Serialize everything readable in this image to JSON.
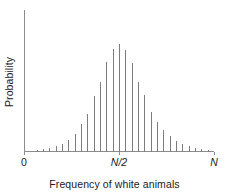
{
  "chart_data": {
    "type": "bar",
    "title": "",
    "subtitle": "",
    "xlabel": "Frequency of white animals",
    "ylabel": "Probability",
    "grid": false,
    "legend": null,
    "style": {
      "bar_color": "#7d7d7d",
      "axis_color": "#8c8c8c",
      "text_color": "#1a1a1a",
      "background": "#ffffff",
      "bar_width_px": 1
    },
    "xlim": [
      0,
      30
    ],
    "ylim": [
      0,
      1.0
    ],
    "x_tick_positions": [
      0,
      15,
      30
    ],
    "x_tick_labels": [
      "0",
      "N/2",
      "N"
    ],
    "x_tick_label_styles": [
      "normal",
      "italic",
      "italic"
    ],
    "categories": [
      0,
      1,
      2,
      3,
      4,
      5,
      6,
      7,
      8,
      9,
      10,
      11,
      12,
      13,
      14,
      15,
      16,
      17,
      18,
      19,
      20,
      21,
      22,
      23,
      24,
      25,
      26,
      27,
      28,
      29,
      30
    ],
    "values": [
      0.0,
      0.0,
      0.012,
      0.021,
      0.028,
      0.042,
      0.056,
      0.085,
      0.127,
      0.197,
      0.268,
      0.394,
      0.493,
      0.634,
      0.725,
      0.761,
      0.718,
      0.627,
      0.493,
      0.401,
      0.282,
      0.211,
      0.155,
      0.113,
      0.077,
      0.056,
      0.042,
      0.028,
      0.021,
      0.014,
      0.0
    ]
  },
  "axis": {
    "y_label": "Probability",
    "x_label": "Frequency of white animals",
    "origin_label": "0"
  }
}
